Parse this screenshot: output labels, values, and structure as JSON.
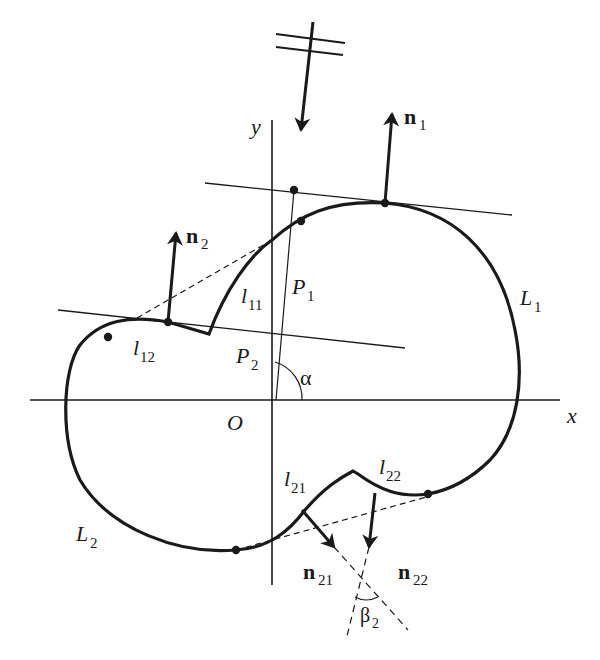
{
  "diagram": {
    "type": "geometry-figure",
    "colors": {
      "stroke": "#1a1a1a",
      "background": "#ffffff"
    },
    "axes": {
      "x_label": "x",
      "y_label": "y",
      "origin_label": "O"
    },
    "curves": {
      "L1": "L",
      "L1_sub": "1",
      "L2": "L",
      "L2_sub": "2"
    },
    "segments": {
      "l11": "l",
      "l11_sub": "11",
      "l12": "l",
      "l12_sub": "12",
      "l21": "l",
      "l21_sub": "21",
      "l22": "l",
      "l22_sub": "22"
    },
    "normals": {
      "n1": "n",
      "n1_sub": "1",
      "n2": "n",
      "n2_sub": "2",
      "n21": "n",
      "n21_sub": "21",
      "n22": "n",
      "n22_sub": "22"
    },
    "points": {
      "P1": "P",
      "P1_sub": "1",
      "P2": "P",
      "P2_sub": "2"
    },
    "angles": {
      "alpha": "α",
      "beta": "β",
      "beta_sub": "2"
    },
    "incident_direction_symbol": "illumination arrow"
  }
}
